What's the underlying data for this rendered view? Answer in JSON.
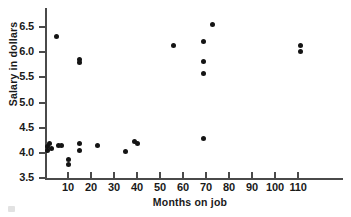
{
  "chart_data": {
    "type": "scatter",
    "title": "",
    "xlabel": "Months on job",
    "ylabel": "Salary in dollars",
    "xlim": [
      0,
      118
    ],
    "ylim": [
      3.5,
      6.75
    ],
    "grid": false,
    "legend": "none",
    "xticks": [
      10,
      20,
      30,
      40,
      50,
      60,
      70,
      80,
      90,
      100,
      110
    ],
    "xtick_labels": [
      "10",
      "20",
      "30",
      "40",
      "50",
      "60",
      "70",
      "80",
      "90",
      "100",
      "110"
    ],
    "yticks": [
      3.5,
      4.0,
      4.5,
      5.0,
      5.5,
      6.0,
      6.5
    ],
    "ytick_labels": [
      "3.5",
      "4.0",
      "4.5",
      "5.0",
      "5.5",
      "6.0",
      "6.5"
    ],
    "marker": "filled-circle",
    "marker_color": "#141414",
    "axis_color": "#4a4a4a",
    "points": [
      {
        "x": 1,
        "y": 4.05
      },
      {
        "x": 1,
        "y": 4.12
      },
      {
        "x": 2,
        "y": 4.18
      },
      {
        "x": 3,
        "y": 4.08
      },
      {
        "x": 5,
        "y": 6.31
      },
      {
        "x": 6,
        "y": 4.15
      },
      {
        "x": 7,
        "y": 4.14
      },
      {
        "x": 10,
        "y": 3.87
      },
      {
        "x": 10,
        "y": 3.76
      },
      {
        "x": 15,
        "y": 4.18
      },
      {
        "x": 15,
        "y": 4.05
      },
      {
        "x": 15,
        "y": 5.85
      },
      {
        "x": 15,
        "y": 5.8
      },
      {
        "x": 23,
        "y": 4.15
      },
      {
        "x": 35,
        "y": 4.02
      },
      {
        "x": 39,
        "y": 4.23
      },
      {
        "x": 40,
        "y": 4.18
      },
      {
        "x": 56,
        "y": 6.14
      },
      {
        "x": 69,
        "y": 6.21
      },
      {
        "x": 69,
        "y": 5.81
      },
      {
        "x": 69,
        "y": 5.57
      },
      {
        "x": 69,
        "y": 4.28
      },
      {
        "x": 73,
        "y": 6.54
      },
      {
        "x": 111,
        "y": 6.13
      },
      {
        "x": 111,
        "y": 6.01
      }
    ]
  }
}
